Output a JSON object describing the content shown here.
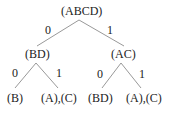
{
  "tree": {
    "root": "(ABCD)",
    "left": {
      "node": "(BD)",
      "edge": "0",
      "children": [
        {
          "node": "(B)",
          "edge": "0"
        },
        {
          "node": "(A),(C)",
          "edge": "1"
        }
      ]
    },
    "right": {
      "node": "(AC)",
      "edge": "1",
      "children": [
        {
          "node": "(BD)",
          "edge": "0"
        },
        {
          "node": "(A),(C)",
          "edge": "1"
        }
      ]
    }
  },
  "colors": {
    "line": "#888888",
    "text": "#222222"
  }
}
